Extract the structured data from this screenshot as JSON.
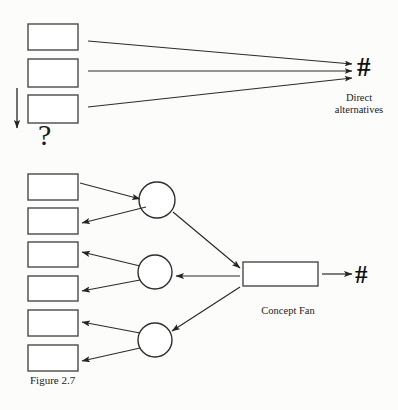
{
  "figure": {
    "caption": "Figure 2.7",
    "background_color": "#fcfcfb",
    "stroke_color": "#3b3b3b",
    "text_color": "#1b1b1b"
  },
  "diagram_top": {
    "name": "direct-alternatives",
    "label": "Direct\nalternatives",
    "target_symbol": "#",
    "question_symbol": "?",
    "boxes": [
      {
        "x": 28,
        "y": 24,
        "w": 50,
        "h": 26
      },
      {
        "x": 28,
        "y": 59,
        "w": 50,
        "h": 28
      },
      {
        "x": 28,
        "y": 95,
        "w": 50,
        "h": 28
      }
    ],
    "flow_arrow": {
      "x": 17,
      "y1": 88,
      "y2": 130,
      "direction": "down"
    },
    "converge_point": {
      "x": 355,
      "y": 70
    }
  },
  "diagram_bottom": {
    "name": "concept-fan",
    "label": "Concept Fan",
    "target_symbol": "#",
    "boxes": [
      {
        "x": 28,
        "y": 174,
        "w": 50,
        "h": 26
      },
      {
        "x": 28,
        "y": 208,
        "w": 50,
        "h": 26
      },
      {
        "x": 28,
        "y": 242,
        "w": 50,
        "h": 25
      },
      {
        "x": 28,
        "y": 276,
        "w": 50,
        "h": 25
      },
      {
        "x": 28,
        "y": 310,
        "w": 50,
        "h": 26
      },
      {
        "x": 28,
        "y": 345,
        "w": 50,
        "h": 26
      }
    ],
    "circles": [
      {
        "cx": 157,
        "cy": 200,
        "r": 18
      },
      {
        "cx": 155,
        "cy": 272,
        "r": 17
      },
      {
        "cx": 155,
        "cy": 340,
        "r": 17
      }
    ],
    "concept_box": {
      "x": 243,
      "y": 262,
      "w": 75,
      "h": 24
    }
  }
}
